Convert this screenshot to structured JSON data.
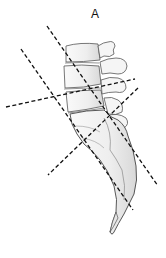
{
  "figure": {
    "panel_label": "A",
    "background_color": "#ffffff",
    "line_color": "#111111",
    "bone_fill": "#f2f2f2",
    "bone_stroke": "#555555",
    "dashed_lines": [
      {
        "name": "steep-axis-line",
        "x1": 47,
        "y1": 26,
        "x2": 158,
        "y2": 186
      },
      {
        "name": "left-diagonal-line",
        "x1": 21,
        "y1": 49,
        "x2": 133,
        "y2": 210
      },
      {
        "name": "near-horizontal-line",
        "x1": 6,
        "y1": 107,
        "x2": 135,
        "y2": 79
      },
      {
        "name": "rising-diagonal-line",
        "x1": 138,
        "y1": 88,
        "x2": 48,
        "y2": 175
      }
    ]
  }
}
